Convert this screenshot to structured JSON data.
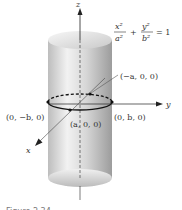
{
  "figure": {
    "axes": {
      "z": "z",
      "y": "y",
      "x": "x"
    },
    "equation": {
      "term1_num": "x²",
      "term1_den": "a²",
      "plus": "+",
      "term2_num": "y²",
      "term2_den": "b²",
      "equals": "= 1"
    },
    "points": {
      "neg_a": "(−a, 0, 0)",
      "neg_b": "(0, −b, 0)",
      "pos_a": "(a, 0, 0)",
      "pos_b": "(0, b, 0)"
    },
    "caption": "Figure 2.34",
    "colors": {
      "cylinder_light": "#f4f4f4",
      "cylinder_dark": "#9a9a9a",
      "line": "#222222"
    }
  }
}
